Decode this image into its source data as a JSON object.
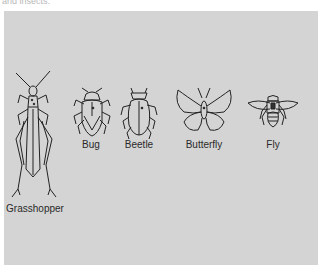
{
  "caption": {
    "text": "and insects."
  },
  "panel": {
    "background": "#d4d4d4",
    "insects": [
      {
        "name": "grasshopper",
        "label": "Grasshopper"
      },
      {
        "name": "bug",
        "label": "Bug"
      },
      {
        "name": "beetle",
        "label": "Beetle"
      },
      {
        "name": "butterfly",
        "label": "Butterfly"
      },
      {
        "name": "fly",
        "label": "Fly"
      }
    ]
  }
}
